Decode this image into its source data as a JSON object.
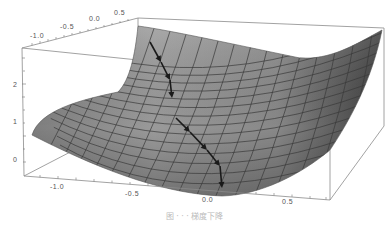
{
  "figure": {
    "caption": "图 · · · 梯度下降",
    "surface_color": "#8a8a8a",
    "grid_color": "#3a3a3a",
    "arrow_color": "#1a1a1a",
    "box_color": "#888888"
  },
  "axes": {
    "x_back": {
      "ticks": [
        "-1.0",
        "-0.5",
        "0.0",
        "0.5"
      ]
    },
    "x_front": {
      "ticks": [
        "-1.0",
        "-0.5",
        "0.0",
        "0.5"
      ]
    },
    "z": {
      "ticks": [
        "0",
        "1",
        "2"
      ]
    }
  },
  "arrows": {
    "count": 7,
    "label": "gradient descent steps"
  }
}
